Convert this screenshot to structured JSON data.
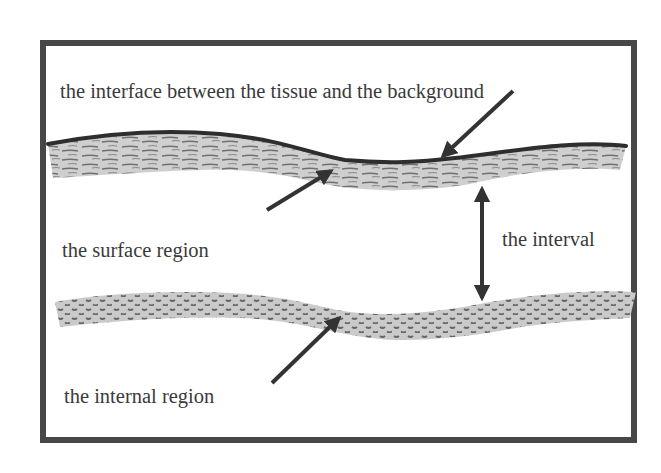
{
  "diagram": {
    "title": "",
    "labels": {
      "interface": "the interface between the tissue and the background",
      "surface_region": "the surface region",
      "interval": "the interval",
      "internal_region": "the internal region"
    },
    "colors": {
      "frame": "#474747",
      "text": "#3a3a3a",
      "arrow": "#333333",
      "band_fill": "#c8c8c8",
      "band_texture": "#6e6e6e",
      "interface_line": "#2e2e2e",
      "background": "#ffffff"
    },
    "elements": [
      {
        "id": "surface-band",
        "texture": "horizontal-streaks",
        "label_ref": "surface_region"
      },
      {
        "id": "interface-line",
        "type": "boundary-curve",
        "label_ref": "interface"
      },
      {
        "id": "internal-band",
        "texture": "dots",
        "label_ref": "internal_region"
      },
      {
        "id": "interval-arrow",
        "type": "double-headed-arrow",
        "label_ref": "interval"
      }
    ]
  }
}
